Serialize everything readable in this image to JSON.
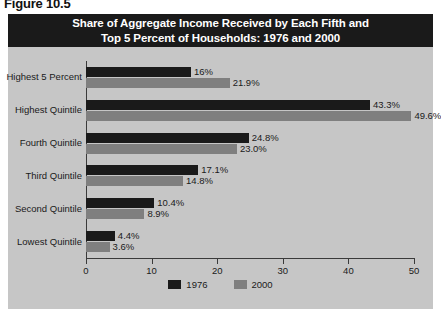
{
  "figure": {
    "label": "Figure 10.5"
  },
  "title": {
    "line1": "Share of Aggregate Income Received by Each Fifth and",
    "line2": "Top 5 Percent of Households: 1976 and 2000"
  },
  "colors": {
    "banner_background": "#1a1a1a",
    "banner_text": "#ffffff",
    "panel_background": "#c6c6c6",
    "series_1976": "#1a1a1a",
    "series_2000": "#7f7f7f",
    "axis": "#3a3a3a",
    "text": "#1a1a1a"
  },
  "chart_data": {
    "type": "bar",
    "orientation": "horizontal",
    "title": "Share of Aggregate Income Received by Each Fifth and Top 5 Percent of Households: 1976 and 2000",
    "xlabel": "",
    "ylabel": "",
    "xlim": [
      0,
      50
    ],
    "xticks": [
      0,
      10,
      20,
      30,
      40,
      50
    ],
    "xtick_labels": [
      "0",
      "10",
      "20",
      "30",
      "40",
      "50"
    ],
    "grid": false,
    "legend_position": "bottom",
    "categories": [
      "Highest 5 Percent",
      "Highest Quintile",
      "Fourth Quintile",
      "Third Quintile",
      "Second Quintile",
      "Lowest Quintile"
    ],
    "series": [
      {
        "name": "1976",
        "color": "#1a1a1a",
        "values": [
          16.0,
          43.3,
          24.8,
          17.1,
          10.4,
          4.4
        ],
        "labels": [
          "16%",
          "43.3%",
          "24.8%",
          "17.1%",
          "10.4%",
          "4.4%"
        ]
      },
      {
        "name": "2000",
        "color": "#7f7f7f",
        "values": [
          21.9,
          49.6,
          23.0,
          14.8,
          8.9,
          3.6
        ],
        "labels": [
          "21.9%",
          "49.6%",
          "23.0%",
          "14.8%",
          "8.9%",
          "3.6%"
        ]
      }
    ]
  },
  "legend": {
    "items": [
      {
        "label": "1976",
        "color": "#1a1a1a"
      },
      {
        "label": "2000",
        "color": "#7f7f7f"
      }
    ]
  }
}
